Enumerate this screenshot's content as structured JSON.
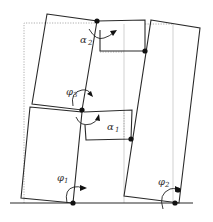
{
  "diagram": {
    "labels": {
      "alpha2": {
        "symbol": "α",
        "sub": "2"
      },
      "alpha1": {
        "symbol": "α",
        "sub": "1"
      },
      "phi3": {
        "symbol": "φ",
        "sub": "3"
      },
      "phi1": {
        "symbol": "φ",
        "sub": "1"
      },
      "phi2": {
        "symbol": "φ",
        "sub": "2"
      }
    },
    "colors": {
      "stroke": "#2a2a2a",
      "dotted": "#9a9a9a",
      "joint": "#111111",
      "background": "#ffffff"
    }
  }
}
